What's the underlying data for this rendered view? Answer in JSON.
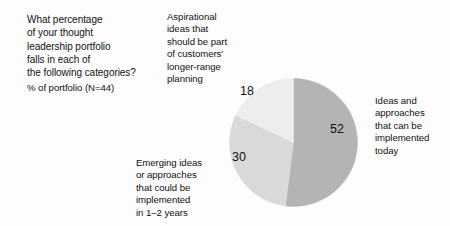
{
  "page": {
    "background_color": "#fdfdfd",
    "text_color": "#111111"
  },
  "question": "What percentage\nof your thought\nleadership portfolio\nfalls in each of\nthe following categories?",
  "subtitle": "% of portfolio (N=44)",
  "labels": {
    "aspirational": "Aspirational\nideas that\nshould be part\nof customers'\nlonger-range\nplanning",
    "today": "Ideas and\napproaches\nthat can be\nimplemented\ntoday",
    "emerging": "Emerging ideas\nor approaches\nthat could be\nimplemented\nin 1–2 years"
  },
  "values": {
    "today": "52",
    "emerging": "30",
    "aspirational": "18"
  },
  "chart_data": {
    "type": "pie",
    "title": "What percentage of your thought leadership portfolio falls in each of the following categories?",
    "subtitle": "% of portfolio (N=44)",
    "unit": "percent",
    "sample_size": 44,
    "categories": [
      "Ideas and approaches that can be implemented today",
      "Emerging ideas or approaches that could be implemented in 1–2 years",
      "Aspirational ideas that should be part of customers' longer-range planning"
    ],
    "values": [
      52,
      30,
      18
    ],
    "data_labels": [
      "52",
      "30",
      "18"
    ],
    "colors": [
      "#b4b4b4",
      "#d9d9d9",
      "#ededed"
    ],
    "start_angle_deg": 0,
    "direction": "clockwise",
    "legend": "none",
    "grid": false,
    "slice_label_positions": [
      "right",
      "lower-left",
      "upper-left"
    ],
    "annotations": [
      {
        "text": "Aspirational ideas that should be part of customers' longer-range planning",
        "position": "top-left-of-pie",
        "points_to_slice": 18
      },
      {
        "text": "Ideas and approaches that can be implemented today",
        "position": "right-of-pie",
        "points_to_slice": 52
      },
      {
        "text": "Emerging ideas or approaches that could be implemented in 1–2 years",
        "position": "bottom-left-of-pie",
        "points_to_slice": 30
      }
    ]
  }
}
